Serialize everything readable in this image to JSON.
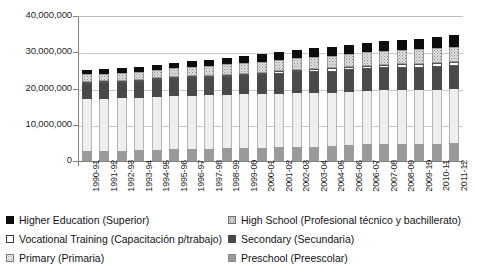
{
  "chart_data": {
    "type": "bar",
    "stacked": true,
    "title": "",
    "subtitle": "",
    "xlabel": "",
    "ylabel": "",
    "ylim": [
      0,
      40000000
    ],
    "ytick_labels": [
      "40,000,000",
      "30,000,000",
      "20,000,000",
      "10,000,000",
      "0"
    ],
    "ytick_values": [
      40000000,
      30000000,
      20000000,
      10000000,
      0
    ],
    "grid": "horizontal",
    "legend_position": "bottom",
    "categories": [
      "1990-91",
      "1991-92",
      "1992-93",
      "1993-94",
      "1994-95",
      "1995-96",
      "1996-97",
      "1997-98",
      "1998-99",
      "1999-00",
      "2000-01",
      "2001-02",
      "2002-03",
      "2003-04",
      "2004-05",
      "2005-06",
      "2006-07",
      "2007-08",
      "2008-09",
      "2009-10",
      "2010-11",
      "2011-12"
    ],
    "stack_order_bottom_to_top": [
      "Preschool (Preescolar)",
      "Primary (Primaria)",
      "Secondary (Secundaria)",
      "Vocational Training (Capacitación p/trabajo)",
      "High School (Profesional técnico y bachillerato)",
      "Higher Education (Superior)"
    ],
    "series": [
      {
        "name": "Preschool (Preescolar)",
        "key": "preschool",
        "color": "#9a9a9a",
        "values": [
          2730000,
          2790000,
          2860000,
          2980000,
          3170000,
          3250000,
          3390000,
          3430000,
          3510000,
          3570000,
          3640000,
          3780000,
          3910000,
          3980000,
          4090000,
          4450000,
          4740000,
          4830000,
          4780000,
          4740000,
          4820000,
          4900000
        ]
      },
      {
        "name": "Primary (Primaria)",
        "key": "primary",
        "color": "#efefef",
        "values": [
          14400000,
          14400000,
          14420000,
          14470000,
          14570000,
          14620000,
          14650000,
          14650000,
          14700000,
          14790000,
          14790000,
          14840000,
          14860000,
          14780000,
          14700000,
          14650000,
          14590000,
          14650000,
          14810000,
          14860000,
          14890000,
          14910000
        ]
      },
      {
        "name": "Secondary (Secundaria)",
        "key": "secondary",
        "color": "#4a4a4a",
        "values": [
          4190000,
          4230000,
          4320000,
          4410000,
          4490000,
          4690000,
          4810000,
          4930000,
          5100000,
          5200000,
          5350000,
          5480000,
          5660000,
          5780000,
          5890000,
          5980000,
          6060000,
          6120000,
          6150000,
          6190000,
          6240000,
          6340000
        ]
      },
      {
        "name": "Vocational Training (Capacitación p/trabajo)",
        "key": "vocational",
        "color": "#ffffff",
        "values": [
          420000,
          430000,
          440000,
          450000,
          460000,
          480000,
          500000,
          520000,
          550000,
          570000,
          620000,
          680000,
          780000,
          830000,
          870000,
          900000,
          930000,
          960000,
          990000,
          1010000,
          1050000,
          1090000
        ]
      },
      {
        "name": "High School (Profesional técnico y bachillerato)",
        "key": "highschool",
        "color": "#e0e0e0",
        "values": [
          2100000,
          2130000,
          2180000,
          2240000,
          2320000,
          2440000,
          2580000,
          2710000,
          2830000,
          2890000,
          2960000,
          3120000,
          3300000,
          3440000,
          3550000,
          3660000,
          3740000,
          3820000,
          3920000,
          4050000,
          4190000,
          4330000
        ]
      },
      {
        "name": "Higher Education (Superior)",
        "key": "higher",
        "color": "#0d0d0d",
        "values": [
          1250000,
          1280000,
          1310000,
          1350000,
          1420000,
          1530000,
          1610000,
          1700000,
          1800000,
          1910000,
          2050000,
          2150000,
          2240000,
          2320000,
          2380000,
          2450000,
          2530000,
          2620000,
          2710000,
          2850000,
          2980000,
          3160000
        ]
      }
    ],
    "totals": [
      25090000,
      25260000,
      25530000,
      25900000,
      26430000,
      27010000,
      27540000,
      27940000,
      28490000,
      28930000,
      29410000,
      30060000,
      30750000,
      31130000,
      31480000,
      32090000,
      32590000,
      33000000,
      33360000,
      33700000,
      34170000,
      34730000
    ]
  },
  "legend": {
    "items": [
      {
        "label": "Higher Education (Superior)",
        "swatch": "higher",
        "column": "left",
        "row": 0
      },
      {
        "label": "Vocational Training (Capacitación p/trabajo)",
        "swatch": "vocational",
        "column": "left",
        "row": 1
      },
      {
        "label": "Primary (Primaria)",
        "swatch": "primary",
        "column": "left",
        "row": 2
      },
      {
        "label": "High School (Profesional técnico y bachillerato)",
        "swatch": "highschool",
        "column": "right",
        "row": 0
      },
      {
        "label": "Secondary (Secundaria)",
        "swatch": "secondary",
        "column": "right",
        "row": 1
      },
      {
        "label": "Preschool (Preescolar)",
        "swatch": "preschool",
        "column": "right",
        "row": 2
      }
    ]
  },
  "colors": {
    "higher": "#0d0d0d",
    "highschool": "#e0e0e0",
    "vocational": "#ffffff",
    "secondary": "#4a4a4a",
    "primary": "#efefef",
    "preschool": "#9a9a9a",
    "gridline": "#c8c8c8",
    "axis": "#808080",
    "text": "#1a1a1a",
    "background": "#ffffff"
  }
}
